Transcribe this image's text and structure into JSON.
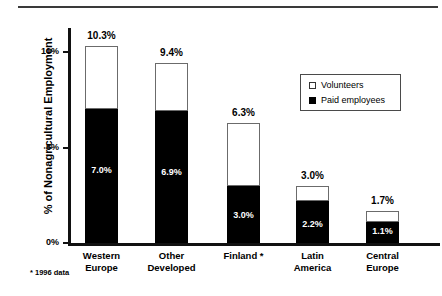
{
  "chart_data": {
    "type": "bar",
    "stacked": true,
    "title": "",
    "xlabel": "",
    "ylabel": "% of Nonagricultural Employment",
    "ylim": [
      0,
      11.5
    ],
    "yticks": [
      0,
      5,
      10
    ],
    "ytick_labels": [
      "0%",
      "5%",
      "10%"
    ],
    "grid": false,
    "legend_position": "upper-right",
    "categories": [
      "Western Europe",
      "Other Developed",
      "Finland *",
      "Latin America",
      "Central Europe"
    ],
    "category_lines": [
      [
        "Western",
        "Europe"
      ],
      [
        "Other",
        "Developed"
      ],
      [
        "Finland *",
        ""
      ],
      [
        "Latin",
        "America"
      ],
      [
        "Central",
        "Europe"
      ]
    ],
    "series": [
      {
        "name": "Paid employees",
        "color": "#000000",
        "values": [
          7.0,
          6.9,
          3.0,
          2.2,
          1.1
        ],
        "labels": [
          "7.0%",
          "6.9%",
          "3.0%",
          "2.2%",
          "1.1%"
        ]
      },
      {
        "name": "Volunteers",
        "color": "#ffffff",
        "values": [
          3.3,
          2.5,
          3.3,
          0.8,
          0.6
        ]
      }
    ],
    "totals": [
      10.3,
      9.4,
      6.3,
      3.0,
      1.7
    ],
    "total_labels": [
      "10.3%",
      "9.4%",
      "6.3%",
      "3.0%",
      "1.7%"
    ],
    "annotations": [
      "* 1996 data"
    ]
  },
  "axis": {
    "y_title": "% of Nonagricultural Employment",
    "ticks": [
      {
        "label": "10%",
        "value": 10
      },
      {
        "label": "5%",
        "value": 5
      },
      {
        "label": "0%",
        "value": 0
      }
    ]
  },
  "legend": {
    "items": [
      {
        "label": "Volunteers",
        "swatch": "white-square"
      },
      {
        "label": "Paid employees",
        "swatch": "black-square"
      }
    ]
  },
  "footnote": {
    "text": "* 1996 data"
  }
}
